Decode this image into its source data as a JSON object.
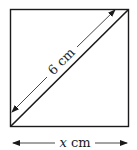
{
  "figure": {
    "shape": "square",
    "diagonal_label": "6 cm",
    "side_label_var": "x",
    "side_label_unit": " cm",
    "colors": {
      "stroke": "#1a1a1a",
      "background": "#ffffff"
    }
  }
}
